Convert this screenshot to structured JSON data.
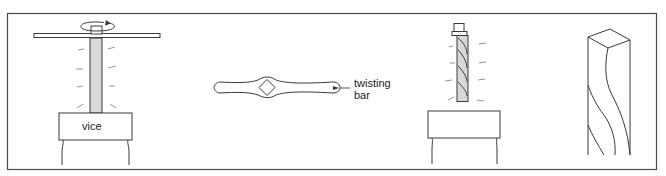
{
  "diagram": {
    "panels": [
      {
        "name": "bar-in-vice-with-tap-wrench",
        "label": "vice"
      },
      {
        "name": "twisting-bar-tool",
        "label_line1": "twisting",
        "label_line2": "bar"
      },
      {
        "name": "twisted-bar-in-vice"
      },
      {
        "name": "twisted-bar-detail"
      }
    ]
  },
  "colors": {
    "stroke": "#3a3a3a",
    "bar_fill": "#d8d8d8",
    "border": "#4a4a4a"
  }
}
